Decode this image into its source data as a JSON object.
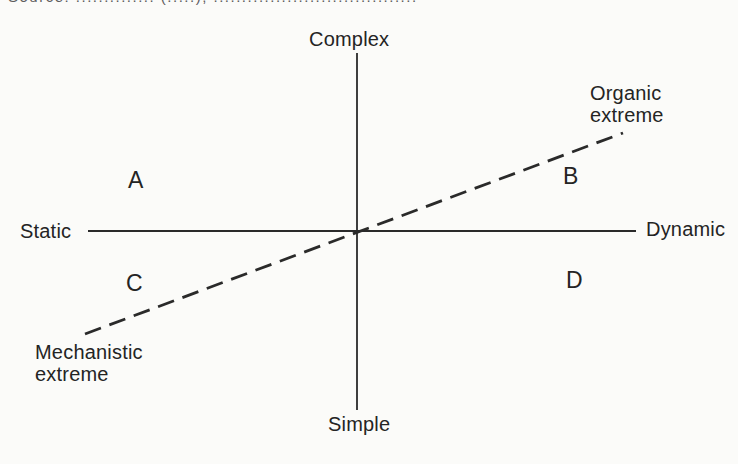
{
  "figure": {
    "background": "#fbfbf9",
    "ink": "#2a2a2a",
    "clipped_top_caption": "Source: .............. (.....), ....................................",
    "axis_labels": {
      "top": "Complex",
      "bottom": "Simple",
      "left": "Static",
      "right": "Dynamic"
    },
    "quadrant_labels": {
      "a": "A",
      "b": "B",
      "c": "C",
      "d": "D"
    },
    "diagonal_labels": {
      "upper": "Organic\nextreme",
      "lower": "Mechanistic\nextreme"
    }
  }
}
